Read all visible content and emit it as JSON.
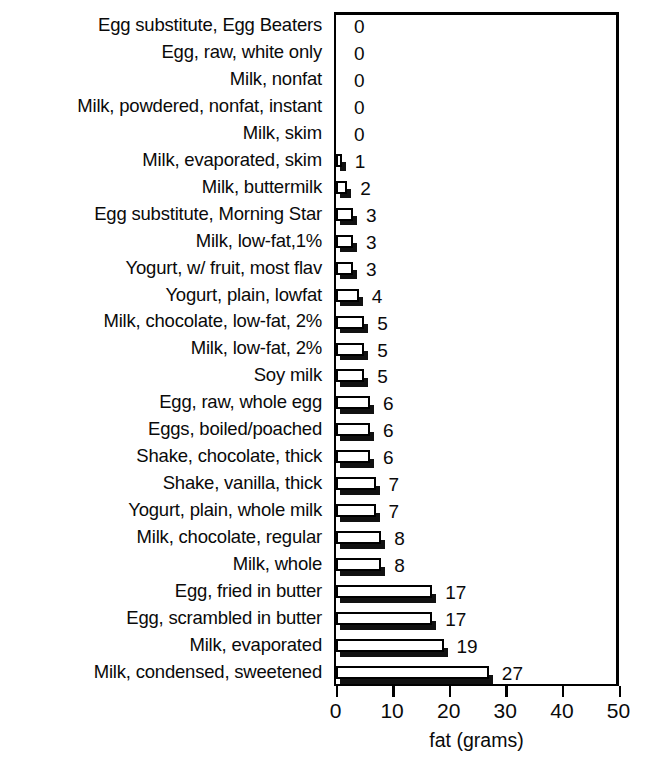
{
  "chart_data": {
    "type": "bar",
    "orientation": "horizontal",
    "title": "",
    "xlabel": "fat (grams)",
    "ylabel": "",
    "xlim": [
      0,
      50
    ],
    "xticks": [
      0,
      10,
      20,
      30,
      40,
      50
    ],
    "xtick_labels": [
      "0",
      "10",
      "20",
      "30",
      "40",
      "50"
    ],
    "grid": false,
    "legend": null,
    "value_labels_shown": true,
    "categories": [
      "Egg substitute, Egg Beaters",
      "Egg, raw, white only",
      "Milk, nonfat",
      "Milk, powdered, nonfat, instant",
      "Milk, skim",
      "Milk, evaporated, skim",
      "Milk, buttermilk",
      "Egg substitute, Morning Star",
      "Milk, low-fat,1%",
      "Yogurt, w/ fruit, most flav",
      "Yogurt, plain, lowfat",
      "Milk, chocolate, low-fat, 2%",
      "Milk, low-fat, 2%",
      "Soy milk",
      "Egg, raw, whole egg",
      "Eggs, boiled/poached",
      "Shake, chocolate, thick",
      "Shake, vanilla, thick",
      "Yogurt, plain, whole milk",
      "Milk, chocolate, regular",
      "Milk, whole",
      "Egg, fried in butter",
      "Egg, scrambled in butter",
      "Milk, evaporated",
      "Milk, condensed, sweetened"
    ],
    "values": [
      0,
      0,
      0,
      0,
      0,
      1,
      2,
      3,
      3,
      3,
      4,
      5,
      5,
      5,
      6,
      6,
      6,
      7,
      7,
      8,
      8,
      17,
      17,
      19,
      27
    ],
    "value_label_text": [
      "0",
      "0",
      "0",
      "0",
      "0",
      "1",
      "2",
      "3",
      "3",
      "3",
      "4",
      "5",
      "5",
      "5",
      "6",
      "6",
      "6",
      "7",
      "7",
      "8",
      "8",
      "17",
      "17",
      "19",
      "27"
    ]
  },
  "colors": {
    "bar_face": "#ffffff",
    "bar_outline": "#000000",
    "bar_shadow": "#111111",
    "text": "#0a0a0a",
    "background": "#ffffff",
    "axis": "#000000"
  }
}
